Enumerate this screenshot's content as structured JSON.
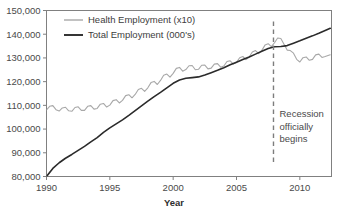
{
  "chart_data": {
    "type": "line",
    "title": "",
    "xlabel": "Year",
    "ylabel": "",
    "grid": false,
    "legend_position": "top-left-inside",
    "xlim": [
      1990,
      2012.5
    ],
    "ylim": [
      80000,
      150000
    ],
    "xticks": [
      "1990",
      "1995",
      "2000",
      "2005",
      "2010"
    ],
    "xtick_values": [
      1990,
      1995,
      2000,
      2005,
      2010
    ],
    "yticks": [
      "80,000",
      "90,000",
      "100,000",
      "110,000",
      "120,000",
      "130,000",
      "140,000",
      "150,000"
    ],
    "ytick_values": [
      80000,
      90000,
      100000,
      110000,
      120000,
      130000,
      140000,
      150000
    ],
    "annotations": [
      {
        "name": "recession-marker",
        "x": 2007.92,
        "lines": [
          "Recession",
          "officially",
          "begins"
        ],
        "style": "dashed-vertical-line",
        "color": "#7d7d7d"
      }
    ],
    "series": [
      {
        "name": "Health Employment (x10)",
        "color": "#a8a8a8",
        "width": 1.1,
        "x": [
          1990.0,
          1990.25,
          1990.5,
          1990.75,
          1991.0,
          1991.25,
          1991.5,
          1991.75,
          1992.0,
          1992.25,
          1992.5,
          1992.75,
          1993.0,
          1993.25,
          1993.5,
          1993.75,
          1994.0,
          1994.25,
          1994.5,
          1994.75,
          1995.0,
          1995.25,
          1995.5,
          1995.75,
          1996.0,
          1996.25,
          1996.5,
          1996.75,
          1997.0,
          1997.25,
          1997.5,
          1997.75,
          1998.0,
          1998.25,
          1998.5,
          1998.75,
          1999.0,
          1999.25,
          1999.5,
          1999.75,
          2000.0,
          2000.25,
          2000.5,
          2000.75,
          2001.0,
          2001.25,
          2001.5,
          2001.75,
          2002.0,
          2002.25,
          2002.5,
          2002.75,
          2003.0,
          2003.25,
          2003.5,
          2003.75,
          2004.0,
          2004.25,
          2004.5,
          2004.75,
          2005.0,
          2005.25,
          2005.5,
          2005.75,
          2006.0,
          2006.25,
          2006.5,
          2006.75,
          2007.0,
          2007.25,
          2007.5,
          2007.75,
          2008.0,
          2008.25,
          2008.5,
          2008.75,
          2009.0,
          2009.25,
          2009.5,
          2009.75,
          2010.0,
          2010.25,
          2010.5,
          2010.75,
          2011.0,
          2011.25,
          2011.5,
          2011.75,
          2012.0,
          2012.4
        ],
        "values": [
          108100,
          109600,
          109900,
          108200,
          107600,
          108900,
          109200,
          107700,
          107500,
          109100,
          109400,
          107900,
          107900,
          109600,
          109900,
          108400,
          108700,
          110500,
          110800,
          109300,
          110100,
          112000,
          112400,
          111000,
          112100,
          114100,
          114500,
          113200,
          114600,
          116700,
          117200,
          115900,
          117400,
          119600,
          120100,
          118800,
          120500,
          122700,
          123200,
          121900,
          123500,
          125600,
          126000,
          124400,
          125100,
          126700,
          126800,
          125000,
          125200,
          126900,
          127000,
          125400,
          125700,
          127400,
          127600,
          126100,
          126600,
          128500,
          128800,
          127400,
          128100,
          130100,
          130600,
          129300,
          130400,
          132500,
          133100,
          131800,
          133200,
          135400,
          136000,
          134800,
          136400,
          138400,
          138200,
          135800,
          133300,
          133100,
          132000,
          129400,
          128300,
          130100,
          130400,
          129000,
          129400,
          131300,
          131600,
          130200,
          130600,
          131300
        ]
      },
      {
        "name": "Total Employment (000's)",
        "color": "#2b2b2b",
        "width": 1.6,
        "x": [
          1990.0,
          1990.5,
          1991.0,
          1991.5,
          1992.0,
          1992.5,
          1993.0,
          1993.5,
          1994.0,
          1994.5,
          1995.0,
          1995.5,
          1996.0,
          1996.5,
          1997.0,
          1997.5,
          1998.0,
          1998.5,
          1999.0,
          1999.5,
          2000.0,
          2000.5,
          2001.0,
          2001.5,
          2002.0,
          2002.5,
          2003.0,
          2003.5,
          2004.0,
          2004.5,
          2005.0,
          2005.5,
          2006.0,
          2006.5,
          2007.0,
          2007.5,
          2008.0,
          2008.5,
          2009.0,
          2009.5,
          2010.0,
          2010.5,
          2011.0,
          2011.5,
          2012.0,
          2012.4
        ],
        "values": [
          80000,
          83400,
          85800,
          87700,
          89300,
          91000,
          92700,
          94600,
          96400,
          98600,
          100500,
          102200,
          103900,
          105800,
          107800,
          109800,
          111800,
          113700,
          115500,
          117400,
          119300,
          120700,
          121400,
          121700,
          122000,
          122800,
          123800,
          124800,
          125900,
          127100,
          128200,
          129300,
          130400,
          131600,
          132800,
          134000,
          134700,
          134800,
          135200,
          136200,
          137200,
          138300,
          139300,
          140400,
          141600,
          142500
        ]
      }
    ]
  },
  "axis": {
    "x_title": "Year",
    "frame_color": "#808080"
  }
}
